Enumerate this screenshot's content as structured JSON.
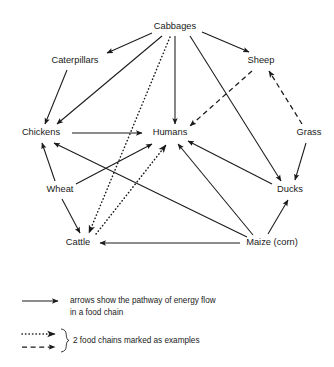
{
  "diagram": {
    "type": "food-web",
    "background_color": "#ffffff",
    "line_color": "#1a1a1a",
    "nodes": [
      {
        "id": "cabbages",
        "label": "Cabbages",
        "x": 175,
        "y": 27
      },
      {
        "id": "caterpillars",
        "label": "Caterpillars",
        "x": 75,
        "y": 61
      },
      {
        "id": "sheep",
        "label": "Sheep",
        "x": 261,
        "y": 61
      },
      {
        "id": "chickens",
        "label": "Chickens",
        "x": 41,
        "y": 133
      },
      {
        "id": "humans",
        "label": "Humans",
        "x": 170,
        "y": 133
      },
      {
        "id": "grass",
        "label": "Grass",
        "x": 309,
        "y": 133
      },
      {
        "id": "wheat",
        "label": "Wheat",
        "x": 60,
        "y": 190
      },
      {
        "id": "ducks",
        "label": "Ducks",
        "x": 290,
        "y": 190
      },
      {
        "id": "cattle",
        "label": "Cattle",
        "x": 78,
        "y": 243
      },
      {
        "id": "maize",
        "label": "Maize (corn)",
        "x": 272,
        "y": 243
      }
    ],
    "edges": [
      {
        "from": "cabbages",
        "to": "caterpillars",
        "style": "solid"
      },
      {
        "from": "cabbages",
        "to": "chickens",
        "style": "solid"
      },
      {
        "from": "cabbages",
        "to": "humans",
        "style": "solid"
      },
      {
        "from": "cabbages",
        "to": "ducks",
        "style": "solid"
      },
      {
        "from": "cabbages",
        "to": "sheep",
        "style": "solid"
      },
      {
        "from": "cabbages",
        "to": "cattle",
        "style": "dotted"
      },
      {
        "from": "caterpillars",
        "to": "chickens",
        "style": "solid"
      },
      {
        "from": "chickens",
        "to": "humans",
        "style": "solid"
      },
      {
        "from": "wheat",
        "to": "chickens",
        "style": "solid"
      },
      {
        "from": "wheat",
        "to": "humans",
        "style": "solid"
      },
      {
        "from": "wheat",
        "to": "cattle",
        "style": "solid"
      },
      {
        "from": "maize",
        "to": "chickens",
        "style": "solid"
      },
      {
        "from": "maize",
        "to": "humans",
        "style": "solid"
      },
      {
        "from": "maize",
        "to": "ducks",
        "style": "solid"
      },
      {
        "from": "maize",
        "to": "cattle",
        "style": "solid"
      },
      {
        "from": "ducks",
        "to": "humans",
        "style": "solid"
      },
      {
        "from": "grass",
        "to": "ducks",
        "style": "solid"
      },
      {
        "from": "grass",
        "to": "sheep",
        "style": "dashed"
      },
      {
        "from": "sheep",
        "to": "humans",
        "style": "dashed"
      },
      {
        "from": "cattle",
        "to": "humans",
        "style": "dotted"
      }
    ],
    "example_chains": [
      {
        "style": "dotted",
        "path": [
          "Cabbages",
          "Cattle",
          "Humans"
        ]
      },
      {
        "style": "dashed",
        "path": [
          "Grass",
          "Sheep",
          "Humans"
        ]
      }
    ]
  },
  "legend": {
    "solid_line_1": "arrows show the pathway of energy flow",
    "solid_line_2": "in a food chain",
    "chains_label": "2 food chains marked as examples"
  }
}
